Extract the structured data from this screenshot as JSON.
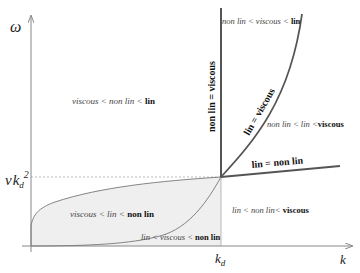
{
  "diagram": {
    "axes": {
      "y_label": "ω",
      "x_label": "k",
      "x_tick": {
        "main": "k",
        "sub": "d"
      },
      "y_tick": {
        "nu": "ν",
        "k": "k",
        "sub": "d",
        "sup": "2"
      }
    },
    "boundaries": {
      "vertical": "non lin = viscous",
      "curve": "lin = viscous",
      "line": "lin = non lin"
    },
    "regions": {
      "upper_left": {
        "a": "viscous",
        "op1": " < ",
        "b": "non lin",
        "op2": " < ",
        "c": "lin"
      },
      "top_right": {
        "a": "non lin",
        "op1": " < ",
        "b": "viscous",
        "op2": " < ",
        "c": "lin"
      },
      "mid_right": {
        "a": "non lin",
        "op1": " < ",
        "b": "lin",
        "op2": " <",
        "c": "viscous"
      },
      "low_right": {
        "a": "lin",
        "op1": " < ",
        "b": "non lin",
        "op2": "< ",
        "c": "viscous"
      },
      "shaded_upper": {
        "a": "viscous",
        "op1": " < ",
        "b": "lin",
        "op2": " < ",
        "c": "non lin"
      },
      "shaded_lower": {
        "a": "lin",
        "op1": " < ",
        "b": "viscous",
        "op2": " < ",
        "c": "non lin"
      }
    },
    "colors": {
      "thick_line": "#555555",
      "axis": "#888888",
      "shade": "#ededed",
      "dashed": "#aaaaaa"
    }
  }
}
